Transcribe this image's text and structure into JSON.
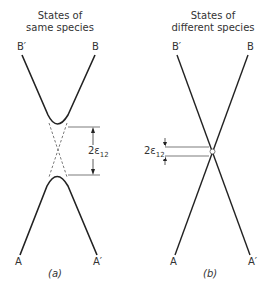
{
  "panel_a": {
    "title_line1": "States of",
    "title_line2": "same species",
    "label_top_left": "B′",
    "label_top_right": "B",
    "label_bottom_left": "A",
    "label_bottom_right": "A′",
    "gap_label": "2ε",
    "gap_subscript": "12",
    "caption": "(a)"
  },
  "panel_b": {
    "title_line1": "States of",
    "title_line2": "different species",
    "label_top_left": "B′",
    "label_top_right": "B",
    "label_bottom_left": "A",
    "label_bottom_right": "A′",
    "gap_label": "2ε",
    "gap_subscript": "12",
    "caption": "(b)"
  },
  "colors": {
    "line": "#222222",
    "dashed": "#555555",
    "guide": "#444444"
  }
}
